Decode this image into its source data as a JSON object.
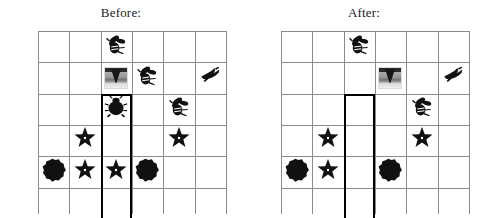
{
  "panels": [
    {
      "key": "before",
      "title": "Before:",
      "grid": {
        "cols": 6,
        "rows": 6,
        "cell": 31.3
      },
      "highlight": {
        "col": 2,
        "row_start": 2,
        "row_end": 6
      },
      "items": [
        {
          "col": 2,
          "row": 0,
          "icon": "bee-icon",
          "label": "bee"
        },
        {
          "col": 2,
          "row": 1,
          "icon": "tornado-photo-icon",
          "label": "tornado photo"
        },
        {
          "col": 3,
          "row": 1,
          "icon": "bee-icon",
          "label": "bee"
        },
        {
          "col": 5,
          "row": 1,
          "icon": "bird-icon",
          "label": "bird"
        },
        {
          "col": 2,
          "row": 2,
          "icon": "beetle-icon",
          "label": "beetle"
        },
        {
          "col": 4,
          "row": 2,
          "icon": "bee-icon",
          "label": "bee"
        },
        {
          "col": 1,
          "row": 3,
          "icon": "star-icon",
          "label": "star"
        },
        {
          "col": 4,
          "row": 3,
          "icon": "star-icon",
          "label": "star"
        },
        {
          "col": 0,
          "row": 4,
          "icon": "blob-icon",
          "label": "blob"
        },
        {
          "col": 1,
          "row": 4,
          "icon": "star-icon",
          "label": "star"
        },
        {
          "col": 2,
          "row": 4,
          "icon": "star-icon",
          "label": "star"
        },
        {
          "col": 3,
          "row": 4,
          "icon": "blob-icon",
          "label": "blob"
        }
      ]
    },
    {
      "key": "after",
      "title": "After:",
      "grid": {
        "cols": 6,
        "rows": 6,
        "cell": 31.3
      },
      "highlight": {
        "col": 2,
        "row_start": 2,
        "row_end": 6
      },
      "items": [
        {
          "col": 2,
          "row": 0,
          "icon": "bee-icon",
          "label": "bee"
        },
        {
          "col": 3,
          "row": 1,
          "icon": "tornado-photo-icon",
          "label": "tornado photo"
        },
        {
          "col": 5,
          "row": 1,
          "icon": "bird-icon",
          "label": "bird"
        },
        {
          "col": 4,
          "row": 2,
          "icon": "bee-icon",
          "label": "bee"
        },
        {
          "col": 1,
          "row": 3,
          "icon": "star-icon",
          "label": "star"
        },
        {
          "col": 4,
          "row": 3,
          "icon": "star-icon",
          "label": "star"
        },
        {
          "col": 0,
          "row": 4,
          "icon": "blob-icon",
          "label": "blob"
        },
        {
          "col": 1,
          "row": 4,
          "icon": "star-icon",
          "label": "star"
        },
        {
          "col": 3,
          "row": 4,
          "icon": "blob-icon",
          "label": "blob"
        }
      ]
    }
  ],
  "colors": {
    "grid_line": "#8a8a8a",
    "highlight_border": "#000000",
    "sprite_fill": "#111111",
    "background": "#ffffff",
    "title_text": "#1a1a1a"
  }
}
